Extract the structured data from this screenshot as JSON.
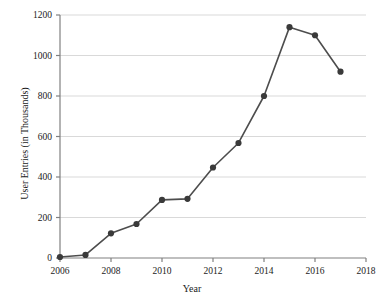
{
  "chart_data": {
    "type": "line",
    "title": "",
    "xlabel": "Year",
    "ylabel": "User Entries (in Thousands)",
    "x": [
      2006,
      2007,
      2008,
      2009,
      2010,
      2011,
      2012,
      2013,
      2014,
      2015,
      2016,
      2017
    ],
    "values": [
      5,
      15,
      122,
      168,
      287,
      292,
      447,
      568,
      800,
      1140,
      1100,
      920
    ],
    "xlim": [
      2006,
      2018
    ],
    "ylim": [
      0,
      1200
    ],
    "xticks": [
      2006,
      2008,
      2010,
      2012,
      2014,
      2016,
      2018
    ],
    "xtick_labels": [
      "2006",
      "2008",
      "2010",
      "2012",
      "2014",
      "2016",
      "2018"
    ],
    "yticks": [
      0,
      200,
      400,
      600,
      800,
      1000,
      1200
    ],
    "ytick_labels": [
      "0",
      "200",
      "400",
      "600",
      "800",
      "1000",
      "1200"
    ],
    "grid": "horizontal",
    "legend": "none",
    "series": [
      {
        "name": "User Entries",
        "values": [
          5,
          15,
          122,
          168,
          287,
          292,
          447,
          568,
          800,
          1140,
          1100,
          920
        ]
      }
    ],
    "colors": {
      "line": "#4d4d4d",
      "marker": "#3a3a3a",
      "grid": "#d9d9d9",
      "axis": "#808080",
      "text": "#1a1a1a",
      "background": "#ffffff"
    }
  }
}
